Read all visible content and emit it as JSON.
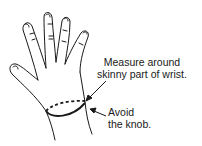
{
  "diagram": {
    "labels": {
      "measure_line1": "Measure around",
      "measure_line2": "skinny part of wrist.",
      "avoid_line1": "Avoid",
      "avoid_line2": "the knob."
    },
    "colors": {
      "stroke": "#1a1a1a",
      "background": "#ffffff"
    }
  }
}
